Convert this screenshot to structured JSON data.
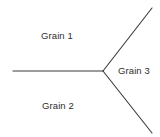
{
  "figure": {
    "kind": "grain-boundary-triple-junction-diagram",
    "width": 160,
    "height": 137,
    "background_color": "#ffffff",
    "line_color": "#3a3a3a",
    "line_width": 1.1,
    "text_color": "#2e2e2e"
  },
  "junction": {
    "name": "triple-point",
    "x": 103,
    "y": 71
  },
  "boundaries": [
    {
      "name": "boundary-left",
      "from_x": 103,
      "from_y": 71,
      "to_x": 13,
      "to_y": 71
    },
    {
      "name": "boundary-upper-right",
      "from_x": 103,
      "from_y": 71,
      "to_x": 152,
      "to_y": 8
    },
    {
      "name": "boundary-lower-right",
      "from_x": 103,
      "from_y": 71,
      "to_x": 152,
      "to_y": 133
    }
  ],
  "labels": {
    "grain_1": "Grain 1",
    "grain_2": "Grain 2",
    "grain_3": "Grain 3"
  }
}
